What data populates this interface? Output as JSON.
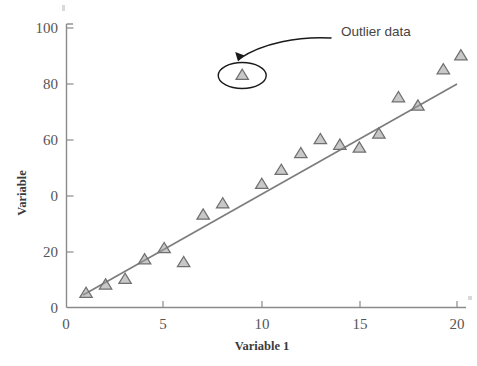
{
  "chart_data": {
    "type": "scatter",
    "title": "",
    "xlabel": "Variable 1",
    "ylabel": "Variable",
    "xlim": [
      0,
      20.8
    ],
    "ylim": [
      0,
      100
    ],
    "grid": false,
    "legend": "none",
    "x_ticks": [
      "0",
      "5",
      "10",
      "15",
      "20"
    ],
    "x_tick_values": [
      0,
      5,
      10,
      15,
      20
    ],
    "y_ticks": [
      "0",
      "20",
      "0",
      "60",
      "80",
      "100"
    ],
    "y_tick_values": [
      0,
      20,
      40,
      60,
      80,
      100
    ],
    "series": [
      {
        "name": "Observations",
        "marker": "triangle-up",
        "marker_color": "#9a9a9a",
        "marker_edge_color": "#6f6f6f",
        "points": [
          {
            "x": 1,
            "y": 5
          },
          {
            "x": 2,
            "y": 8
          },
          {
            "x": 3,
            "y": 10
          },
          {
            "x": 4,
            "y": 17
          },
          {
            "x": 5,
            "y": 21
          },
          {
            "x": 6,
            "y": 16
          },
          {
            "x": 7,
            "y": 33
          },
          {
            "x": 8,
            "y": 37
          },
          {
            "x": 9,
            "y": 83
          },
          {
            "x": 10,
            "y": 44
          },
          {
            "x": 11,
            "y": 49
          },
          {
            "x": 12,
            "y": 55
          },
          {
            "x": 13,
            "y": 60
          },
          {
            "x": 14,
            "y": 58
          },
          {
            "x": 15,
            "y": 57
          },
          {
            "x": 16,
            "y": 62
          },
          {
            "x": 17,
            "y": 75
          },
          {
            "x": 18,
            "y": 72
          },
          {
            "x": 19.3,
            "y": 85
          },
          {
            "x": 20.2,
            "y": 90
          }
        ]
      }
    ],
    "trend_line": {
      "name": "Linear fit",
      "color": "#7d7d7d",
      "x_start": 0.85,
      "y_start": 4.5,
      "x_end": 20.0,
      "y_end": 80.0
    },
    "annotations": [
      {
        "label": "Outlier data",
        "kind": "callout",
        "target_point": {
          "x": 9,
          "y": 83
        },
        "highlight": "ellipse",
        "arrow": "curved"
      }
    ]
  },
  "axes": {
    "x_title": "Variable 1",
    "y_title": "Variable"
  },
  "annotation": {
    "outlier_label": "Outlier data"
  }
}
